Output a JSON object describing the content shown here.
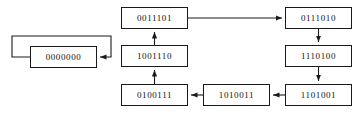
{
  "diagram": {
    "type": "state-transition-graph",
    "background_color": "#ffffff",
    "node_border_color": "#1a1a1a",
    "edge_color": "#1a1a1a",
    "label_color": "#111111",
    "nodes": [
      {
        "id": "zero",
        "label": "0000000",
        "x": 30,
        "y": 46,
        "w": 67,
        "h": 22
      },
      {
        "id": "top_center",
        "label": "0011101",
        "x": 121,
        "y": 7,
        "w": 67,
        "h": 22
      },
      {
        "id": "top_right",
        "label": "0111010",
        "x": 285,
        "y": 7,
        "w": 67,
        "h": 22
      },
      {
        "id": "mid_center",
        "label": "1001110",
        "x": 121,
        "y": 45,
        "w": 67,
        "h": 22
      },
      {
        "id": "mid_right",
        "label": "1110100",
        "x": 285,
        "y": 45,
        "w": 67,
        "h": 22
      },
      {
        "id": "bottom_left",
        "label": "0100111",
        "x": 121,
        "y": 84,
        "w": 67,
        "h": 22
      },
      {
        "id": "bottom_mid",
        "label": "1010011",
        "x": 203,
        "y": 84,
        "w": 67,
        "h": 22
      },
      {
        "id": "bottom_right",
        "label": "1101001",
        "x": 285,
        "y": 84,
        "w": 67,
        "h": 22
      }
    ],
    "edges": [
      {
        "id": "zero-self-loop",
        "from": "zero",
        "to": "zero",
        "kind": "self-loop"
      },
      {
        "id": "top_center-to-top_right",
        "from": "top_center",
        "to": "top_right",
        "kind": "horizontal-right"
      },
      {
        "id": "top_right-to-mid_right",
        "from": "top_right",
        "to": "mid_right",
        "kind": "vertical-down"
      },
      {
        "id": "mid_right-to-bottom_right",
        "from": "mid_right",
        "to": "bottom_right",
        "kind": "vertical-down"
      },
      {
        "id": "bottom_right-to-bottom_mid",
        "from": "bottom_right",
        "to": "bottom_mid",
        "kind": "horizontal-left"
      },
      {
        "id": "bottom_mid-to-bottom_left",
        "from": "bottom_mid",
        "to": "bottom_left",
        "kind": "horizontal-left"
      },
      {
        "id": "bottom_left-to-mid_center",
        "from": "bottom_left",
        "to": "mid_center",
        "kind": "vertical-up"
      },
      {
        "id": "mid_center-to-top_center",
        "from": "mid_center",
        "to": "top_center",
        "kind": "vertical-up"
      }
    ]
  }
}
